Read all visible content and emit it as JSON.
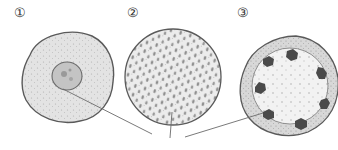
{
  "figure": {
    "labels": [
      "①",
      "②",
      "③"
    ],
    "cells": [
      {
        "id": "1",
        "description": "round cell with central nucleus, granular cytoplasm"
      },
      {
        "id": "2",
        "description": "round cell densely filled with oval granules"
      },
      {
        "id": "3",
        "description": "round cell with thick granular rim and seven dark bodies around inner border"
      }
    ],
    "colors": {
      "outline": "#5a5a5a",
      "fill": "#dcdcdc",
      "granule": "#8c8c8c",
      "dark_body": "#4a4a4a",
      "line": "#6a6a6a"
    }
  }
}
